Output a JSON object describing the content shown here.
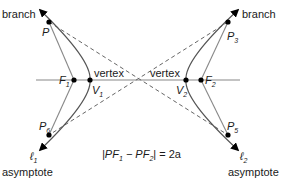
{
  "diagram": {
    "labels": {
      "branch_left": "branch",
      "branch_right": "branch",
      "vertex_left": "vertex",
      "vertex_right": "vertex",
      "asymptote_left": "asymptote",
      "asymptote_right": "asymptote"
    },
    "points": {
      "P": {
        "main": "P",
        "sub": ""
      },
      "P3": {
        "main": "P",
        "sub": "3"
      },
      "P5": {
        "main": "P",
        "sub": "5"
      },
      "P6": {
        "main": "P",
        "sub": "6"
      },
      "F1": {
        "main": "F",
        "sub": "1"
      },
      "F2": {
        "main": "F",
        "sub": "2"
      },
      "V1": {
        "main": "V",
        "sub": "1"
      },
      "V2": {
        "main": "V",
        "sub": "2"
      },
      "l1": {
        "main": "ℓ",
        "sub": "1"
      },
      "l2": {
        "main": "ℓ",
        "sub": "2"
      }
    },
    "equation": {
      "part1": "|PF",
      "sub1": "1",
      "part2": " − PF",
      "sub2": "2",
      "part3": "| = 2a"
    },
    "colors": {
      "curve": "#555555",
      "axis": "#888888",
      "asymptote": "#666666",
      "point": "#000000"
    }
  }
}
